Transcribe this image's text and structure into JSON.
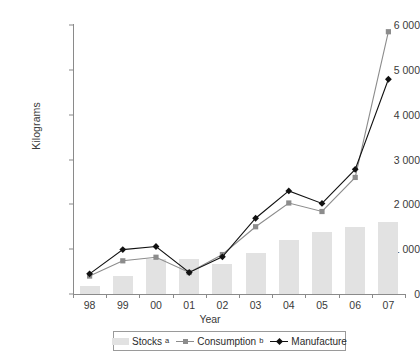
{
  "chart_data": {
    "type": "bar",
    "title": "",
    "xlabel": "Year",
    "ylabel": "Kilograms",
    "categories": [
      "98",
      "99",
      "00",
      "01",
      "02",
      "03",
      "04",
      "05",
      "06",
      "07"
    ],
    "ylim": [
      0,
      6000
    ],
    "yticks": [
      0,
      1000,
      2000,
      3000,
      4000,
      5000,
      6000
    ],
    "ytick_labels": [
      "0",
      "1 000",
      "2 000",
      "3 000",
      "4 000",
      "5 000",
      "6 000"
    ],
    "grid": false,
    "legend_position": "bottom",
    "series": [
      {
        "name": "Stocks",
        "name_superscript": "a",
        "kind": "bar",
        "color": "#e2e2e2",
        "values": [
          180,
          400,
          780,
          780,
          670,
          920,
          1200,
          1380,
          1500,
          1600
        ]
      },
      {
        "name": "Consumption",
        "name_superscript": "b",
        "kind": "line",
        "color": "#8c8c8c",
        "marker": "square",
        "values": [
          400,
          740,
          820,
          480,
          880,
          1500,
          2030,
          1840,
          2600,
          5850
        ]
      },
      {
        "name": "Manufacture",
        "name_superscript": "",
        "kind": "line",
        "color": "#111111",
        "marker": "diamond",
        "values": [
          450,
          990,
          1060,
          480,
          830,
          1690,
          2300,
          2020,
          2780,
          4790
        ]
      }
    ]
  },
  "legend": {
    "stocks_label": "Stocks",
    "stocks_sup": "a",
    "consumption_label": "Consumption",
    "consumption_sup": "b",
    "manufacture_label": "Manufacture"
  }
}
